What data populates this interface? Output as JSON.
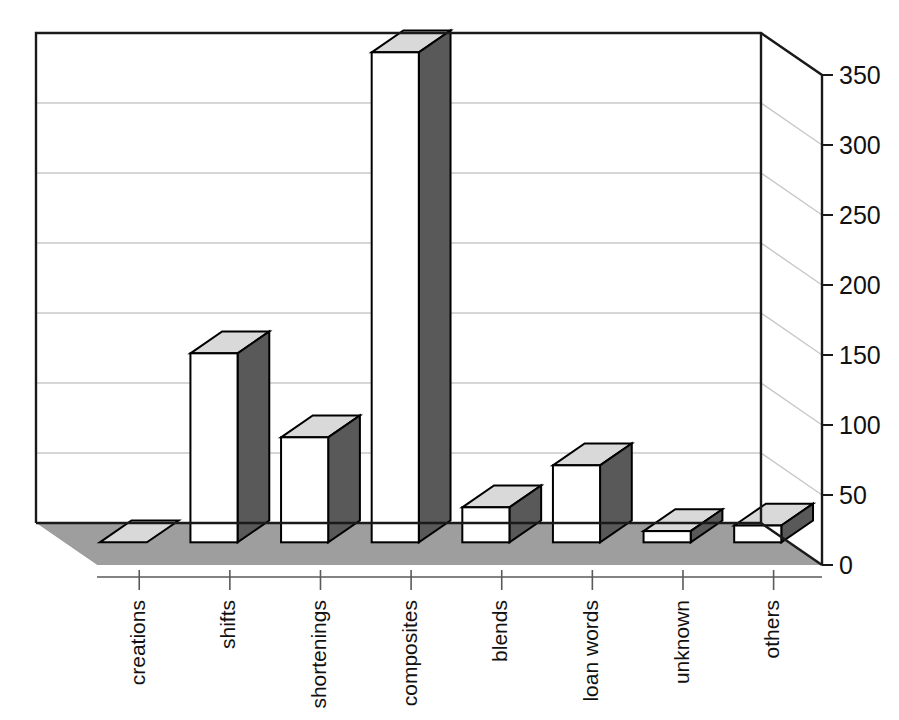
{
  "chart_data": {
    "type": "bar",
    "title": "",
    "subtitle": "",
    "xlabel": "",
    "ylabel": "",
    "categories": [
      "creations",
      "shifts",
      "shortenings",
      "composites",
      "blends",
      "loan words",
      "unknown",
      "others"
    ],
    "values": [
      0,
      135,
      75,
      350,
      25,
      55,
      8,
      12
    ],
    "series": [
      {
        "name": "",
        "values": [
          0,
          135,
          75,
          350,
          25,
          55,
          8,
          12
        ]
      }
    ],
    "ylim": [
      0,
      350
    ],
    "ytick_labels": [
      "0",
      "50",
      "100",
      "150",
      "200",
      "250",
      "300",
      "350"
    ],
    "ytick_values": [
      0,
      50,
      100,
      150,
      200,
      250,
      300,
      350
    ],
    "grid": true,
    "grid_axis": "y",
    "legend": false,
    "legend_position": "none",
    "rendering": "3d-column",
    "tick_label_rotation_deg": -90,
    "colors": {
      "bar_front": "#ffffff",
      "bar_side": "#595959",
      "bar_top": "#d9d9d9",
      "bar_outline": "#000000",
      "floor": "#9e9e9e",
      "wall": "#ffffff",
      "gridline": "#bfbfbf",
      "axis_line": "#000000",
      "text": "#111111",
      "background": "#ffffff"
    }
  },
  "plot_geometry": {
    "wall_left_x": 36,
    "wall_right_x": 761,
    "wall_top_y": 33,
    "wall_bottom_y": 523,
    "depth_dx": 61,
    "depth_dy": 42,
    "px_per_unit": 1.4
  }
}
